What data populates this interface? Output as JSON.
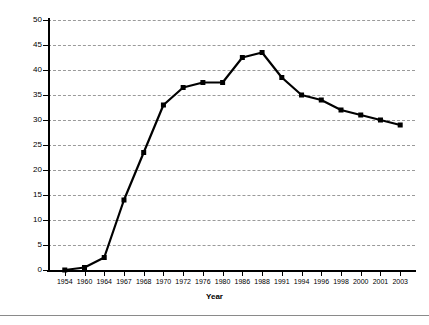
{
  "chart_data": {
    "type": "line",
    "title": "",
    "xlabel": "Year",
    "ylabel": "Percent",
    "categories": [
      "1954",
      "1960",
      "1964",
      "1967",
      "1968",
      "1970",
      "1972",
      "1976",
      "1980",
      "1986",
      "1988",
      "1991",
      "1994",
      "1996",
      "1998",
      "2000",
      "2001",
      "2003"
    ],
    "values": [
      0,
      0.5,
      2.5,
      14,
      23.5,
      33,
      36.5,
      37.5,
      37.5,
      42.5,
      43.5,
      38.5,
      35,
      34,
      32,
      31,
      30,
      29
    ],
    "series": [
      {
        "name": "Percent",
        "values": [
          0,
          0.5,
          2.5,
          14,
          23.5,
          33,
          36.5,
          37.5,
          37.5,
          42.5,
          43.5,
          38.5,
          35,
          34,
          32,
          31,
          30,
          29
        ]
      }
    ],
    "ylim": [
      0,
      50
    ],
    "ytick_labels": [
      "0",
      "5",
      "10",
      "15",
      "20",
      "25",
      "30",
      "35",
      "40",
      "45",
      "50"
    ],
    "ytick_values": [
      0,
      5,
      10,
      15,
      20,
      25,
      30,
      35,
      40,
      45,
      50
    ],
    "grid": "horizontal-dashed",
    "legend": "none",
    "marker": "square",
    "line_color": "#000000",
    "marker_color": "#000000",
    "grid_color": "#9a9a9a",
    "axis_color": "#000000",
    "background_color": "#ffffff"
  }
}
